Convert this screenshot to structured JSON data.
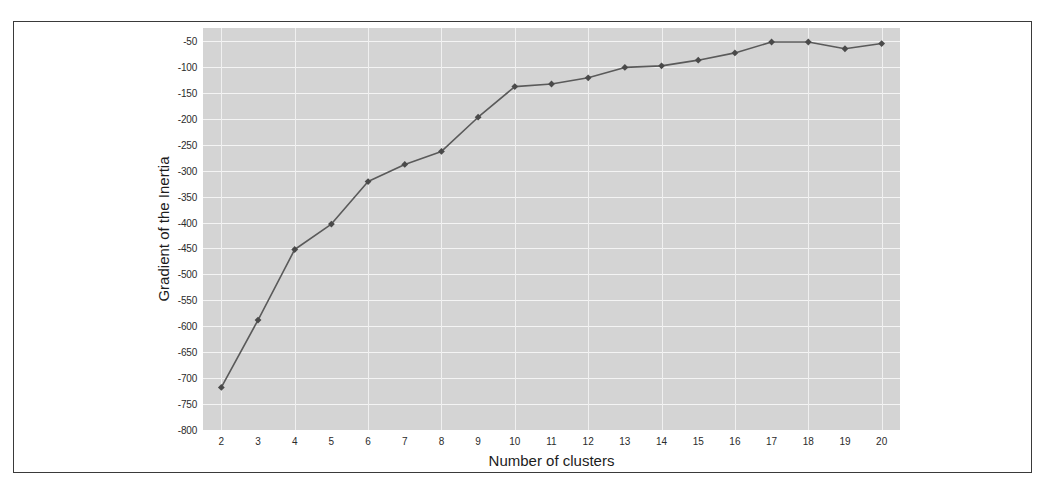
{
  "chart_data": {
    "type": "line",
    "title": "",
    "xlabel": "Number of clusters",
    "ylabel": "Gradient of the Inertia",
    "x": [
      2,
      3,
      4,
      5,
      6,
      7,
      8,
      9,
      10,
      11,
      12,
      13,
      14,
      15,
      16,
      17,
      18,
      19,
      20
    ],
    "values": [
      -718,
      -588,
      -452,
      -403,
      -321,
      -288,
      -263,
      -197,
      -138,
      -133,
      -121,
      -101,
      -98,
      -87,
      -73,
      -52,
      -52,
      -65,
      -55
    ],
    "series": [
      {
        "name": "Gradient of the Inertia",
        "values": [
          -718,
          -588,
          -452,
          -403,
          -321,
          -288,
          -263,
          -197,
          -138,
          -133,
          -121,
          -101,
          -98,
          -87,
          -73,
          -52,
          -52,
          -65,
          -55
        ]
      }
    ],
    "xlim": [
      1.5,
      20.5
    ],
    "ylim": [
      -800,
      -25
    ],
    "xticks": [
      2,
      3,
      4,
      5,
      6,
      7,
      8,
      9,
      10,
      11,
      12,
      13,
      14,
      15,
      16,
      17,
      18,
      19,
      20
    ],
    "xtick_labels": [
      "2",
      "3",
      "4",
      "5",
      "6",
      "7",
      "8",
      "9",
      "10",
      "11",
      "12",
      "13",
      "14",
      "15",
      "16",
      "17",
      "18",
      "19",
      "20"
    ],
    "yticks": [
      -50,
      -100,
      -150,
      -200,
      -250,
      -300,
      -350,
      -400,
      -450,
      -500,
      -550,
      -600,
      -650,
      -700,
      -750,
      -800
    ],
    "ytick_labels": [
      "-50",
      "-100",
      "-150",
      "-200",
      "-250",
      "-300",
      "-350",
      "-400",
      "-450",
      "-500",
      "-550",
      "-600",
      "-650",
      "-700",
      "-750",
      "-800"
    ],
    "grid": true,
    "grid_axes": "both",
    "legend": false,
    "legend_position": "none",
    "marker": "diamond",
    "colors": {
      "line": "#5a5a5a",
      "marker": "#4a4a4a",
      "plot_background": "#d4d4d4",
      "gridline": "#f4f4f4",
      "figure_background": "#ffffff",
      "frame_border": "#3a3a3a",
      "tick_text": "#2b2b2b",
      "axis_label_text": "#1c1c1c"
    }
  }
}
